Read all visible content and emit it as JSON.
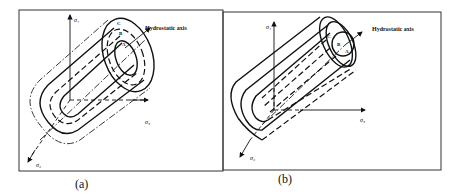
{
  "panels": [
    {
      "id": "a",
      "caption": "(a)",
      "hydrostatic_label": "Hydrostatic axis",
      "axes": {
        "sigma1": "σ₁",
        "sigma2": "σ₂",
        "sigma3": "σ₃"
      },
      "points": [
        "C",
        "B",
        "A"
      ]
    },
    {
      "id": "b",
      "caption": "(b)",
      "hydrostatic_label": "Hydrostatic axis",
      "axes": {
        "sigma1": "σ₁",
        "sigma2": "σ₂",
        "sigma3": "σ₃"
      },
      "points": [
        "C",
        "B",
        "A"
      ]
    }
  ]
}
